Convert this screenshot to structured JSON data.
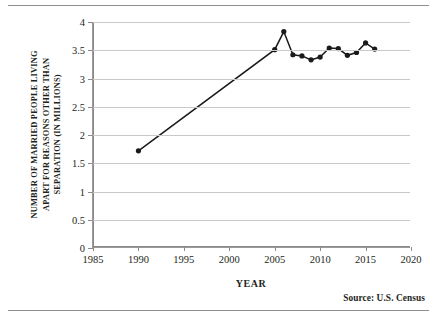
{
  "figure": {
    "source_note": "Source:  U.S. Census"
  },
  "chart_data": {
    "type": "line",
    "title": "",
    "xlabel": "YEAR",
    "ylabel": "NUMBER OF MARRIED PEOPLE LIVING APART FOR REASONS OTHER THAN SEPARATION (IN MILLIONS)",
    "ylabel_lines": [
      "NUMBER OF MARRIED PEOPLE LIVING",
      "APART FOR REASONS OTHER THAN",
      "SEPARATION (IN MILLIONS)"
    ],
    "xlim": [
      1985,
      2020
    ],
    "ylim": [
      0,
      4
    ],
    "xticks": [
      1985,
      1990,
      1995,
      2000,
      2005,
      2010,
      2015,
      2020
    ],
    "xticklabels": [
      "1985",
      "1990",
      "1995",
      "2000",
      "2005",
      "2010",
      "2015",
      "2020"
    ],
    "yticks": [
      0,
      0.5,
      1,
      1.5,
      2,
      2.5,
      3,
      3.5,
      4
    ],
    "yticklabels": [
      "0",
      "0.5",
      "1",
      "1.5",
      "2",
      "2.5",
      "3",
      "3.5",
      "4"
    ],
    "grid": "horizontal",
    "legend": "none",
    "marker": "filled-circle",
    "line_color": "#1a1a1a",
    "grid_color": "#c9c9c9",
    "x": [
      1990,
      2005,
      2006,
      2007,
      2008,
      2009,
      2010,
      2011,
      2012,
      2013,
      2014,
      2015,
      2016
    ],
    "y": [
      1.72,
      3.51,
      3.83,
      3.42,
      3.4,
      3.33,
      3.38,
      3.54,
      3.53,
      3.41,
      3.46,
      3.63,
      3.52
    ],
    "series": [
      {
        "name": "Married people living apart (millions)",
        "values": [
          1.72,
          3.51,
          3.83,
          3.42,
          3.4,
          3.33,
          3.38,
          3.54,
          3.53,
          3.41,
          3.46,
          3.63,
          3.52
        ]
      }
    ]
  }
}
